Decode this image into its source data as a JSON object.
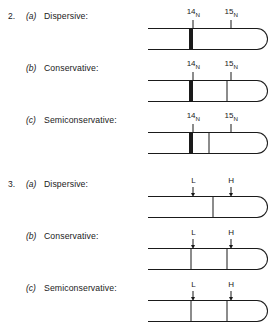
{
  "figure": {
    "background_color": "#ffffff",
    "ink_color": "#1a1a1a"
  },
  "groups": [
    {
      "number": "2.",
      "marker_style": "isotope",
      "markers": [
        {
          "mass": "14",
          "element": "N",
          "x_pct": 36
        },
        {
          "mass": "15",
          "element": "N",
          "x_pct": 66
        }
      ],
      "rows": [
        {
          "letter": "(a)",
          "label": "Dispersive:",
          "bands": [
            {
              "type": "thick",
              "x_pct": 36
            }
          ]
        },
        {
          "letter": "(b)",
          "label": "Conservative:",
          "bands": [
            {
              "type": "thick",
              "x_pct": 36
            },
            {
              "type": "thin",
              "x_pct": 66
            }
          ]
        },
        {
          "letter": "(c)",
          "label": "Semiconservative:",
          "bands": [
            {
              "type": "thick",
              "x_pct": 36
            },
            {
              "type": "thin",
              "x_pct": 51
            }
          ]
        }
      ]
    },
    {
      "number": "3.",
      "marker_style": "arrow",
      "markers": [
        {
          "text": "L",
          "x_pct": 36
        },
        {
          "text": "H",
          "x_pct": 66
        }
      ],
      "rows": [
        {
          "letter": "(a)",
          "label": "Dispersive:",
          "bands": [
            {
              "type": "thin",
              "x_pct": 54
            }
          ]
        },
        {
          "letter": "(b)",
          "label": "Conservative:",
          "bands": [
            {
              "type": "thin",
              "x_pct": 36
            },
            {
              "type": "thin",
              "x_pct": 66
            }
          ]
        },
        {
          "letter": "(c)",
          "label": "Semiconservative:",
          "bands": [
            {
              "type": "thin",
              "x_pct": 36
            },
            {
              "type": "thin",
              "x_pct": 66
            }
          ]
        }
      ]
    }
  ]
}
